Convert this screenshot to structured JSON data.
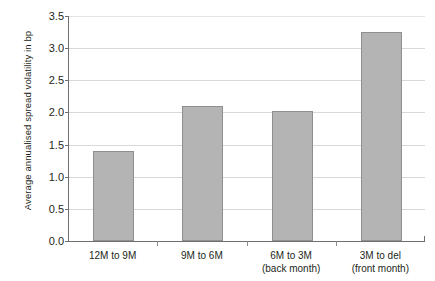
{
  "chart_data": {
    "type": "bar",
    "title": "",
    "xlabel": "",
    "ylabel": "Average annualised spread volatility in bp",
    "categories": [
      "12M to 9M",
      "9M to 6M",
      "6M to 3M",
      "3M to del"
    ],
    "category_sublabels": [
      "",
      "",
      "(back month)",
      "(front month)"
    ],
    "values": [
      1.4,
      2.1,
      2.02,
      3.25
    ],
    "ylim": [
      0.0,
      3.5
    ],
    "ytick_labels": [
      "0.0",
      "0.5",
      "1.0",
      "1.5",
      "2.0",
      "2.5",
      "3.0",
      "3.5"
    ],
    "ytick_values": [
      0.0,
      0.5,
      1.0,
      1.5,
      2.0,
      2.5,
      3.0,
      3.5
    ],
    "grid": "horizontal",
    "legend": "none",
    "series": [
      {
        "name": "Average annualised spread volatility",
        "values": [
          1.4,
          2.1,
          2.02,
          3.25
        ]
      }
    ],
    "colors": {
      "bar_fill": "#b4b4b4",
      "bar_border": "#8f8f8f",
      "gridline": "#d9d9d9",
      "axis": "#6f6f6f",
      "text": "#231f20",
      "background": "#ffffff"
    }
  }
}
